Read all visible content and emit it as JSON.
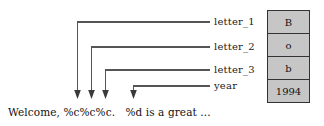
{
  "diagram": {
    "wire_color": "#555555",
    "table_fill": "#c6c6c6",
    "table_border": "#333333"
  },
  "variables": [
    {
      "name": "letter_1",
      "value": "B"
    },
    {
      "name": "letter_2",
      "value": "o"
    },
    {
      "name": "letter_3",
      "value": "b"
    },
    {
      "name": "year",
      "value": "1994"
    }
  ],
  "code": {
    "line": "Welcome, %c%c%c.   %d is a great ..."
  }
}
